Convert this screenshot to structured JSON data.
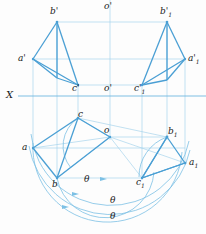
{
  "figure": {
    "type": "descriptive-geometry-projection-drawing",
    "title": "",
    "axis_label": "X",
    "colors": {
      "line": "#4a9fd4",
      "line_light": "#a8d4ec",
      "text": "#1a1a1a",
      "background": "#fdfdfd"
    },
    "labels": {
      "x_axis": "X",
      "o_prime_top": "o'",
      "o_prime_mid": "o'",
      "o_plan": "o",
      "a_prime": "a'",
      "b_prime": "b'",
      "c_prime": "c'",
      "a_prime_1": "a'",
      "a_prime_1_sub": "1",
      "b_prime_1": "b'",
      "b_prime_1_sub": "1",
      "c_prime_1": "c'",
      "c_prime_1_sub": "1",
      "a_plan": "a",
      "b_plan": "b",
      "c_plan": "c",
      "a_plan_1": "a",
      "a_plan_1_sub": "1",
      "b_plan_1": "b",
      "b_plan_1_sub": "1",
      "c_plan_1": "c",
      "c_plan_1_sub": "1",
      "theta_1": "θ",
      "theta_2": "θ",
      "theta_3": "θ"
    },
    "points": {
      "b_prime": [
        57,
        22
      ],
      "a_prime": [
        33,
        59
      ],
      "c_prime": [
        78,
        85
      ],
      "b_prime_1": [
        167,
        22
      ],
      "a_prime_1": [
        185,
        59
      ],
      "c_prime_1": [
        142,
        85
      ],
      "c_plan": [
        78,
        118
      ],
      "a_plan": [
        33,
        148
      ],
      "b_plan": [
        57,
        178
      ],
      "o_plan": [
        110,
        137
      ],
      "b_plan_1": [
        167,
        137
      ],
      "a_plan_1": [
        185,
        163
      ],
      "c_plan_1": [
        142,
        178
      ],
      "o_prime_mid": [
        110,
        85
      ]
    },
    "x_axis_y": 96,
    "arc_radii": [
      45,
      62,
      78
    ],
    "vertical_lines_x": [
      33,
      57,
      78,
      110,
      142,
      167,
      185
    ]
  }
}
